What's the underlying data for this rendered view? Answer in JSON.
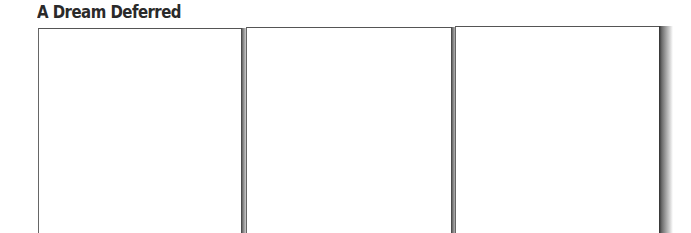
{
  "title": "A Dream Deferred",
  "panels": [
    {
      "index": 1,
      "content": ""
    },
    {
      "index": 2,
      "content": ""
    },
    {
      "index": 3,
      "content": ""
    }
  ]
}
